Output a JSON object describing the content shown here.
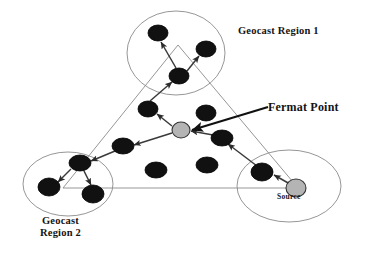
{
  "figure": {
    "background_color": "#ffffff",
    "width": 375,
    "height": 255
  },
  "labels": {
    "region1": "Geocast Region 1",
    "fermat_point": "Fermat Point",
    "region2_line1": "Geocast",
    "region2_line2": "Region 2",
    "source": "Source"
  },
  "colors": {
    "node_fill": "#111111",
    "node_stroke": "#000000",
    "special_node_fill": "#b4b4b4",
    "special_node_stroke": "#333333",
    "region_circle_stroke": "#8a8a8a",
    "triangle_stroke": "#8a8a8a",
    "arrow_stroke": "#3a3a3a",
    "leader_stroke": "#111111",
    "text": "#141414"
  },
  "regions": [
    {
      "name": "geocast-region-1",
      "cx": 176,
      "cy": 53,
      "rx": 49,
      "ry": 42
    },
    {
      "name": "geocast-region-2",
      "cx": 68,
      "cy": 184,
      "rx": 45,
      "ry": 32
    },
    {
      "name": "source-region",
      "cx": 289,
      "cy": 186,
      "rx": 52,
      "ry": 36
    }
  ],
  "triangle": {
    "name": "coverage-triangle",
    "points": "178,45 63,188 298,188"
  },
  "nodes": [
    {
      "name": "node-r1-top",
      "cx": 158,
      "cy": 33,
      "rx": 10,
      "ry": 8,
      "type": "relay"
    },
    {
      "name": "node-r1-right",
      "cx": 206,
      "cy": 49,
      "rx": 10,
      "ry": 8,
      "type": "relay"
    },
    {
      "name": "node-r1-center",
      "cx": 179,
      "cy": 76,
      "rx": 10,
      "ry": 8,
      "type": "relay"
    },
    {
      "name": "node-mid-left",
      "cx": 148,
      "cy": 109,
      "rx": 10,
      "ry": 8,
      "type": "relay"
    },
    {
      "name": "node-mid-right",
      "cx": 206,
      "cy": 113,
      "rx": 10,
      "ry": 8,
      "type": "idle"
    },
    {
      "name": "node-fermat",
      "cx": 181,
      "cy": 130,
      "rx": 9,
      "ry": 8,
      "type": "fermat"
    },
    {
      "name": "node-east-relay",
      "cx": 222,
      "cy": 138,
      "rx": 11,
      "ry": 8,
      "type": "relay"
    },
    {
      "name": "node-west-relay",
      "cx": 123,
      "cy": 146,
      "rx": 11,
      "ry": 8,
      "type": "relay"
    },
    {
      "name": "node-r2-hub",
      "cx": 80,
      "cy": 163,
      "rx": 11,
      "ry": 8,
      "type": "relay"
    },
    {
      "name": "node-r2-left",
      "cx": 49,
      "cy": 187,
      "rx": 11,
      "ry": 9,
      "type": "relay"
    },
    {
      "name": "node-r2-bottom",
      "cx": 93,
      "cy": 194,
      "rx": 11,
      "ry": 9,
      "type": "relay"
    },
    {
      "name": "node-center-low-left",
      "cx": 156,
      "cy": 170,
      "rx": 11,
      "ry": 8,
      "type": "idle"
    },
    {
      "name": "node-center-low-right",
      "cx": 207,
      "cy": 165,
      "rx": 11,
      "ry": 8,
      "type": "idle"
    },
    {
      "name": "node-src-relay",
      "cx": 262,
      "cy": 172,
      "rx": 11,
      "ry": 9,
      "type": "relay"
    },
    {
      "name": "node-source",
      "cx": 296,
      "cy": 188,
      "rx": 10,
      "ry": 9,
      "type": "source"
    }
  ],
  "route_arrows": [
    {
      "name": "arrow-source-to-relay",
      "x1": 290,
      "y1": 184,
      "x2": 274,
      "y2": 175
    },
    {
      "name": "arrow-relay-to-east",
      "x1": 257,
      "y1": 166,
      "x2": 228,
      "y2": 144
    },
    {
      "name": "arrow-east-to-fermat",
      "x1": 213,
      "y1": 135,
      "x2": 191,
      "y2": 131
    },
    {
      "name": "arrow-fermat-to-midleft",
      "x1": 172,
      "y1": 126,
      "x2": 157,
      "y2": 114
    },
    {
      "name": "arrow-midleft-to-r1c",
      "x1": 150,
      "y1": 101,
      "x2": 172,
      "y2": 82
    },
    {
      "name": "arrow-r1c-to-top",
      "x1": 176,
      "y1": 68,
      "x2": 161,
      "y2": 42
    },
    {
      "name": "arrow-r1c-to-right",
      "x1": 187,
      "y1": 71,
      "x2": 199,
      "y2": 56
    },
    {
      "name": "arrow-fermat-to-west",
      "x1": 172,
      "y1": 133,
      "x2": 134,
      "y2": 145
    },
    {
      "name": "arrow-west-to-r2hub",
      "x1": 115,
      "y1": 151,
      "x2": 91,
      "y2": 161
    },
    {
      "name": "arrow-r2hub-to-left",
      "x1": 71,
      "y1": 169,
      "x2": 58,
      "y2": 182
    },
    {
      "name": "arrow-r2hub-to-bottom",
      "x1": 84,
      "y1": 171,
      "x2": 91,
      "y2": 185
    }
  ],
  "leader_line": {
    "name": "fermat-leader-line",
    "x1": 268,
    "y1": 107,
    "x2": 192,
    "y2": 130
  }
}
